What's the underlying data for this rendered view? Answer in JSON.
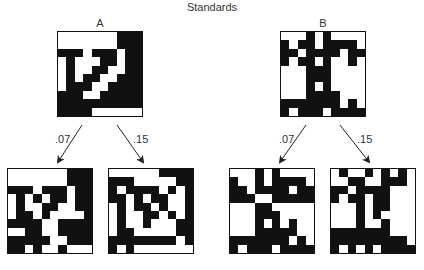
{
  "title": "Standards",
  "standards": [
    {
      "label": "A",
      "pattern": [
        "0000000111",
        "0000000111",
        "1110111011",
        "0100011011",
        "0100110011",
        "0101100111",
        "0111001111",
        "1110011111",
        "1111111111",
        "1111000000"
      ]
    },
    {
      "label": "B",
      "pattern": [
        "0001010000",
        "1011011110",
        "1101111011",
        "1011010010",
        "0001110000",
        "0001110000",
        "0001010000",
        "0001111000",
        "1111111010",
        "1011101111"
      ]
    }
  ],
  "transforms": [
    {
      "source": "A",
      "arrows": [
        {
          "label": ".07"
        },
        {
          "label": ".15"
        }
      ],
      "results": [
        {
          "pattern": [
            "0000000111",
            "0000000111",
            "1110111011",
            "0101011011",
            "0100110011",
            "0110100001",
            "1111001111",
            "0011001111",
            "1111100111",
            "1101001000"
          ]
        },
        {
          "pattern": [
            "0000001111",
            "1110000011",
            "1011110101",
            "1101011001",
            "0101101001",
            "0100110101",
            "0100100011",
            "0110000011",
            "1111111101",
            "1010000000"
          ]
        }
      ]
    },
    {
      "source": "B",
      "arrows": [
        {
          "label": ".07"
        },
        {
          "label": ".15"
        }
      ],
      "results": [
        {
          "pattern": [
            "0001010000",
            "1001011110",
            "1101111011",
            "1110011111",
            "0001100000",
            "0001110000",
            "0001010100",
            "0001111100",
            "1111111010",
            "1011101111"
          ]
        },
        {
          "pattern": [
            "0100101010",
            "0011001110",
            "1101111000",
            "1011011000",
            "0001011000",
            "0001010000",
            "0001001000",
            "1111111000",
            "1111111110",
            "1010101111"
          ]
        }
      ]
    }
  ]
}
